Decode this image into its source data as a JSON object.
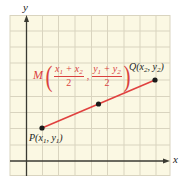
{
  "figure": {
    "title": "",
    "axes": {
      "x_label": "x",
      "y_label": "y"
    },
    "grid": {
      "cols": 10,
      "rows": 10,
      "background": "#fbf8e3",
      "line_color": "#d9d4bf"
    },
    "colors": {
      "segment": "#e0413f",
      "point": "#1a1a1a",
      "axis": "#3a3a32",
      "midpoint_label": "#d9413f"
    },
    "points": {
      "P": {
        "name": "P",
        "coord_x": "x",
        "coord_x_sub": "1",
        "coord_y": "y",
        "coord_y_sub": "1"
      },
      "Q": {
        "name": "Q",
        "coord_x": "x",
        "coord_x_sub": "2",
        "coord_y": "y",
        "coord_y_sub": "2"
      },
      "M": {
        "name": "M",
        "x_num_a": "x",
        "x_num_a_sub": "1",
        "x_plus": " + ",
        "x_num_b": "x",
        "x_num_b_sub": "2",
        "x_den": "2",
        "comma": ",",
        "y_num_a": "y",
        "y_num_a_sub": "1",
        "y_plus": " + ",
        "y_num_b": "y",
        "y_num_b_sub": "2",
        "y_den": "2"
      }
    },
    "punct": {
      "open": "(",
      "sep": ", ",
      "close": ")"
    }
  }
}
